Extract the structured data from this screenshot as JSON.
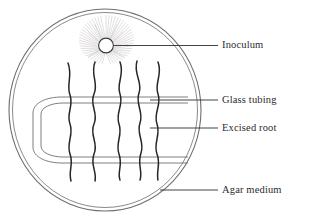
{
  "figure": {
    "background_color": "#ffffff",
    "ink_color": "#2b2b2b",
    "faint_ink_color": "#8a8a8a"
  },
  "dish": {
    "name": "petri-dish",
    "shape": "double-circle",
    "center_x": 105,
    "center_y": 110,
    "radius_outer": 97,
    "radius_inner": 93,
    "stroke_color": "#6b6b6b"
  },
  "inoculum": {
    "name": "inoculum",
    "center_x": 106,
    "center_y": 45,
    "radius": 7.5,
    "fill": "#ffffff",
    "stroke_color": "#3a3a3a",
    "hyphae_count": 46,
    "hyphae_length": 30,
    "hyphae_color": "#b9b2b2"
  },
  "glass_tubing": {
    "name": "glass-tubing",
    "shape": "u-shaped-hairpin",
    "opening_side": "right",
    "top_y": 100,
    "bottom_y": 160,
    "left_x": 33,
    "right_x": 188,
    "wall_gap": 6,
    "stroke_color": "#6b6b6b"
  },
  "roots": {
    "name": "excised-roots",
    "count": 5,
    "x_positions": [
      71,
      96,
      119,
      140,
      158
    ],
    "top_y": 62,
    "bottom_y": 181,
    "stroke_color": "#262626",
    "wave_amplitude": 5
  },
  "labels": [
    {
      "id": "inoculum",
      "text": "Inoculum",
      "leader_from_x": 114,
      "leader_from_y": 45,
      "leader_to_x": 218,
      "leader_to_y": 45
    },
    {
      "id": "glass-tubing",
      "text": "Glass tubing",
      "leader_from_x": 150,
      "leader_from_y": 100,
      "leader_to_x": 218,
      "leader_to_y": 100
    },
    {
      "id": "excised-root",
      "text": "Excised root",
      "leader_from_x": 150,
      "leader_from_y": 128,
      "leader_to_x": 218,
      "leader_to_y": 128
    },
    {
      "id": "agar-medium",
      "text": "Agar medium",
      "leader_from_x": 160,
      "leader_from_y": 190,
      "leader_to_x": 218,
      "leader_to_y": 190
    }
  ]
}
